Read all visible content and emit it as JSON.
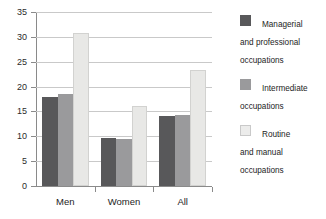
{
  "chart_data": {
    "type": "bar",
    "title": "",
    "subtitle": "",
    "xlabel": "",
    "ylabel": "",
    "categories": [
      "Men",
      "Women",
      "All"
    ],
    "series": [
      {
        "name": "Managerial and professional occupations",
        "color": "#58585a",
        "values": [
          18.0,
          9.7,
          14.0
        ]
      },
      {
        "name": "Intermediate occupations",
        "color": "#9a9a9c",
        "values": [
          18.5,
          9.5,
          14.2
        ]
      },
      {
        "name": "Routine and manual occupations",
        "color": "#e8e8e6",
        "values": [
          30.7,
          16.0,
          23.4
        ]
      }
    ],
    "ylim": [
      0,
      35
    ],
    "ytick_step": 5,
    "ytick_labels": [
      "0",
      "5",
      "10",
      "15",
      "20",
      "25",
      "30",
      "35"
    ],
    "grid": true,
    "legend_position": "right",
    "annotations": []
  },
  "legend": {
    "items": [
      {
        "label": "Managerial\nand professional\noccupations",
        "swatch": "managerial-swatch"
      },
      {
        "label": "Intermediate\noccupations",
        "swatch": "intermediate-swatch"
      },
      {
        "label": "Routine\nand manual\noccupations",
        "swatch": "routine-swatch"
      }
    ]
  },
  "axes": {
    "y_labels": [
      "35",
      "30",
      "25",
      "20",
      "15",
      "10",
      "5",
      "0"
    ],
    "x_labels": [
      "Men",
      "Women",
      "All"
    ]
  }
}
